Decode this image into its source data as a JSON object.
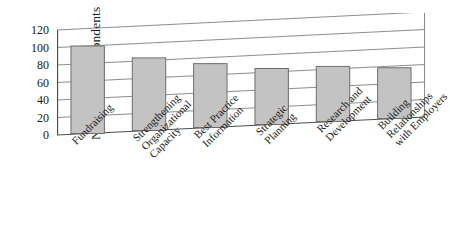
{
  "chart_data": {
    "type": "bar",
    "title": "",
    "subtitle": "",
    "xlabel": "",
    "ylabel": "Number of Respondents",
    "ylabel_note": "n = 243",
    "ylim": [
      0,
      120
    ],
    "yticks": [
      120,
      100,
      80,
      60,
      40,
      20,
      0
    ],
    "grid": true,
    "legend": "none",
    "categories": [
      "Fundraising",
      "Strengthening Organizational Capacity",
      "Best Practice Information",
      "Strategic Planning",
      "Research and Development",
      "Building Relationships with Employers"
    ],
    "category_lines": [
      [
        "Fundraising"
      ],
      [
        "Strengthening",
        "Organizational",
        "Capacity"
      ],
      [
        "Best Practice",
        "Information"
      ],
      [
        "Strategic",
        "Planning"
      ],
      [
        "Research and",
        "Development"
      ],
      [
        "Building",
        "Relationships",
        "with Employers"
      ]
    ],
    "values": [
      100,
      83,
      73,
      64,
      63,
      58
    ],
    "colors": {
      "bar_fill": "#c3c3c3",
      "bar_stroke": "#6e6e6e",
      "axis": "#4d4d4d",
      "grid": "#808080",
      "text": "#1a1a1a"
    }
  }
}
